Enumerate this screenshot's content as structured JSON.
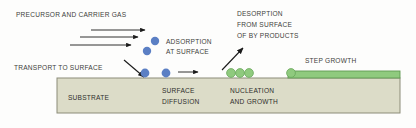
{
  "diagram": {
    "background_color": "#fdfdfc",
    "labels": {
      "precursor": "PRECURSOR AND CARRIER GAS",
      "transport": "TRANSPORT TO SURFACE",
      "adsorption_line1": "ADSORPTION",
      "adsorption_line2": "AT SURFACE",
      "desorption_line1": "DESORPTION",
      "desorption_line2": "FROM SURFACE",
      "desorption_line3": "OF BY PRODUCTS",
      "step_growth": "STEP GROWTH",
      "substrate": "SUBSTRATE",
      "surface_diffusion_line1": "SURFACE",
      "surface_diffusion_line2": "DIFFUSION",
      "nucleation_line1": "NUCLEATION",
      "nucleation_line2": "AND GROWTH"
    },
    "colors": {
      "text": "#3d3d3b",
      "text_dark": "#2e2e2c",
      "substrate_fill": "#dcdcc8",
      "substrate_stroke": "#8c8c78",
      "film_fill": "#8fca7e",
      "film_stroke": "#5f9a52",
      "particle_blue": "#5b7fc4",
      "particle_green": "#8fca7e",
      "particle_green_stroke": "#6aa85c",
      "arrow": "#1a1a1a"
    },
    "substrate": {
      "x": 57,
      "y": 78,
      "width": 343,
      "height": 35
    },
    "film": {
      "x": 288,
      "y": 71,
      "width": 112,
      "height": 7
    },
    "gas_arrows": [
      {
        "x1": 91,
        "y1": 30,
        "x2": 145,
        "y2": 30
      },
      {
        "x1": 80,
        "y1": 37,
        "x2": 138,
        "y2": 37
      },
      {
        "x1": 70,
        "y1": 45,
        "x2": 131,
        "y2": 45
      }
    ],
    "transport_arrow": {
      "x1": 124,
      "y1": 60,
      "x2": 144,
      "y2": 77
    },
    "diffusion_arrow": {
      "x1": 178,
      "y1": 72,
      "x2": 198,
      "y2": 72
    },
    "desorption_arrow": {
      "x1": 222,
      "y1": 70,
      "x2": 243,
      "y2": 48
    },
    "blue_particles": [
      {
        "cx": 155,
        "cy": 41,
        "r": 4.2
      },
      {
        "cx": 147,
        "cy": 51,
        "r": 4.2
      },
      {
        "cx": 145,
        "cy": 73,
        "r": 4.4
      },
      {
        "cx": 166,
        "cy": 73,
        "r": 4.4
      }
    ],
    "green_cluster_particles": [
      {
        "cx": 231,
        "cy": 73,
        "r": 4.4
      },
      {
        "cx": 240,
        "cy": 73,
        "r": 4.4
      },
      {
        "cx": 249,
        "cy": 73,
        "r": 4.4
      }
    ],
    "step_growth_particle": {
      "cx": 291,
      "cy": 73,
      "r": 4.4
    },
    "text_positions": {
      "precursor": {
        "x": 16,
        "y": 15
      },
      "transport": {
        "x": 14,
        "y": 68
      },
      "adsorption_line1": {
        "x": 166,
        "y": 42
      },
      "adsorption_line2": {
        "x": 166,
        "y": 52
      },
      "desorption_line1": {
        "x": 237,
        "y": 14
      },
      "desorption_line2": {
        "x": 237,
        "y": 25
      },
      "desorption_line3": {
        "x": 237,
        "y": 36
      },
      "step_growth": {
        "x": 305,
        "y": 61
      },
      "substrate": {
        "x": 68,
        "y": 98
      },
      "surface_diffusion_line1": {
        "x": 162,
        "y": 91
      },
      "surface_diffusion_line2": {
        "x": 162,
        "y": 102
      },
      "nucleation_line1": {
        "x": 230,
        "y": 91
      },
      "nucleation_line2": {
        "x": 230,
        "y": 102
      }
    }
  }
}
